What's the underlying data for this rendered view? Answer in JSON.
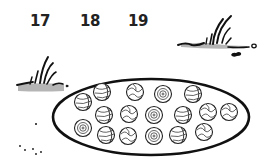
{
  "numbers": [
    {
      "label": "17",
      "x": 30
    },
    {
      "label": "18",
      "x": 80
    },
    {
      "label": "19",
      "x": 128
    }
  ],
  "ellipse": {
    "cx": 151,
    "cy": 117,
    "rx": 98,
    "ry": 38,
    "stroke": "#111111"
  },
  "balls": [
    {
      "x": 102,
      "y": 92,
      "style": "stripe"
    },
    {
      "x": 135,
      "y": 92,
      "style": "wave"
    },
    {
      "x": 163,
      "y": 94,
      "style": "swirl"
    },
    {
      "x": 193,
      "y": 94,
      "style": "stripe"
    },
    {
      "x": 83,
      "y": 102,
      "style": "stripe"
    },
    {
      "x": 104,
      "y": 115,
      "style": "stripe"
    },
    {
      "x": 129,
      "y": 114,
      "style": "wave"
    },
    {
      "x": 154,
      "y": 115,
      "style": "swirl"
    },
    {
      "x": 183,
      "y": 115,
      "style": "stripe"
    },
    {
      "x": 208,
      "y": 112,
      "style": "wave"
    },
    {
      "x": 229,
      "y": 112,
      "style": "wave"
    },
    {
      "x": 83,
      "y": 128,
      "style": "swirl"
    },
    {
      "x": 106,
      "y": 135,
      "style": "stripe"
    },
    {
      "x": 128,
      "y": 136,
      "style": "wave"
    },
    {
      "x": 154,
      "y": 136,
      "style": "swirl"
    },
    {
      "x": 178,
      "y": 135,
      "style": "stripe"
    },
    {
      "x": 204,
      "y": 132,
      "style": "wave"
    }
  ],
  "ball_count": 17,
  "colors": {
    "grass_fill": "#b5b5b5",
    "ink": "#111111"
  }
}
